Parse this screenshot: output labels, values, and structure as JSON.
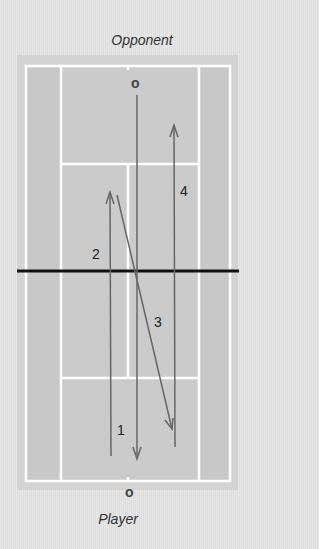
{
  "labels": {
    "top": "Opponent",
    "bottom": "Player"
  },
  "markers": {
    "opponent": "o",
    "player": "o"
  },
  "shot_numbers": [
    "1",
    "2",
    "3",
    "4"
  ],
  "colors": {
    "background": "#e2e2e2",
    "court_surround": "#d3d3d3",
    "court": "#cbcbcb",
    "lines": "#ffffff",
    "net": "#111111",
    "shot_path": "#666666",
    "text": "#333333"
  }
}
